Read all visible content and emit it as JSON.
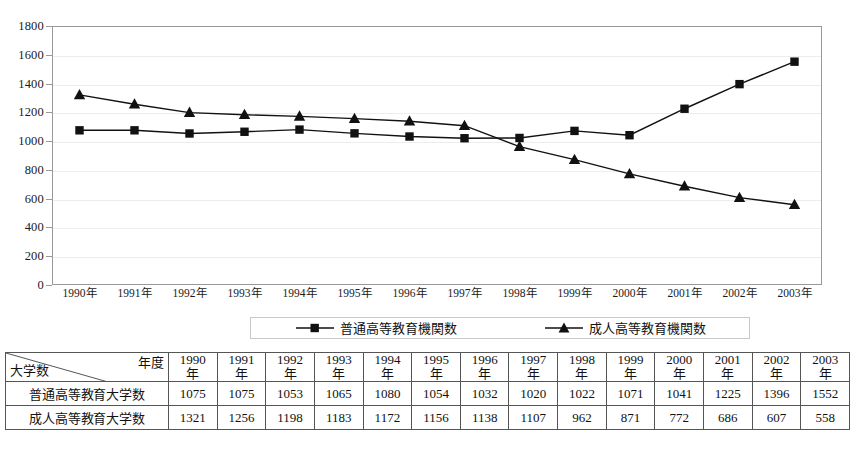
{
  "chart_data": {
    "type": "line",
    "title": "",
    "xlabel": "",
    "ylabel": "",
    "ylim": [
      0,
      1800
    ],
    "ytick_step": 200,
    "yticks": [
      0,
      200,
      400,
      600,
      800,
      1000,
      1200,
      1400,
      1600,
      1800
    ],
    "grid": true,
    "legend_position": "bottom",
    "categories": [
      "1990年",
      "1991年",
      "1992年",
      "1993年",
      "1994年",
      "1995年",
      "1996年",
      "1997年",
      "1998年",
      "1999年",
      "2000年",
      "2001年",
      "2002年",
      "2003年"
    ],
    "series": [
      {
        "name": "普通高等教育機関数",
        "marker": "square",
        "color": "#111111",
        "values": [
          1075,
          1075,
          1053,
          1065,
          1080,
          1054,
          1032,
          1020,
          1022,
          1071,
          1041,
          1225,
          1396,
          1552
        ]
      },
      {
        "name": "成人高等教育機関数",
        "marker": "triangle",
        "color": "#111111",
        "values": [
          1321,
          1256,
          1198,
          1183,
          1172,
          1156,
          1138,
          1107,
          962,
          871,
          772,
          686,
          607,
          558
        ]
      }
    ]
  },
  "legend": {
    "entries": [
      {
        "label": "普通高等教育機関数",
        "marker": "square"
      },
      {
        "label": "成人高等教育機関数",
        "marker": "triangle"
      }
    ]
  },
  "table": {
    "corner": {
      "top_right": "年度",
      "bottom_left": "大学数"
    },
    "year_columns": [
      {
        "num": "1990",
        "suffix": "年"
      },
      {
        "num": "1991",
        "suffix": "年"
      },
      {
        "num": "1992",
        "suffix": "年"
      },
      {
        "num": "1993",
        "suffix": "年"
      },
      {
        "num": "1994",
        "suffix": "年"
      },
      {
        "num": "1995",
        "suffix": "年"
      },
      {
        "num": "1996",
        "suffix": "年"
      },
      {
        "num": "1997",
        "suffix": "年"
      },
      {
        "num": "1998",
        "suffix": "年"
      },
      {
        "num": "1999",
        "suffix": "年"
      },
      {
        "num": "2000",
        "suffix": "年"
      },
      {
        "num": "2001",
        "suffix": "年"
      },
      {
        "num": "2002",
        "suffix": "年"
      },
      {
        "num": "2003",
        "suffix": "年"
      }
    ],
    "rows": [
      {
        "label": "普通高等教育大学数",
        "values": [
          "1075",
          "1075",
          "1053",
          "1065",
          "1080",
          "1054",
          "1032",
          "1020",
          "1022",
          "1071",
          "1041",
          "1225",
          "1396",
          "1552"
        ]
      },
      {
        "label": "成人高等教育大学数",
        "values": [
          "1321",
          "1256",
          "1198",
          "1183",
          "1172",
          "1156",
          "1138",
          "1107",
          "962",
          "871",
          "772",
          "686",
          "607",
          "558"
        ]
      }
    ]
  },
  "colors": {
    "series": "#111111",
    "gridline": "#ededed",
    "plot_border": "#999999",
    "table_border": "#555555",
    "legend_border": "#c9c9c9"
  }
}
